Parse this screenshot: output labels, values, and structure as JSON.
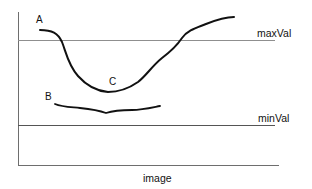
{
  "diagram": {
    "type": "threshold-curves",
    "colors": {
      "axis": "#6e6e6e",
      "threshold_line": "#8f8f8f",
      "curve": "#111111",
      "text": "#111111",
      "background": "#ffffff"
    },
    "x_axis_label": "image",
    "thresholds": {
      "max_label": "maxVal",
      "min_label": "minVal"
    },
    "point_labels": {
      "a": "A",
      "b": "B",
      "c": "C"
    },
    "curves": [
      {
        "id": "curve-A",
        "description": "Starts above maxVal at A, dips below maxVal to a minimum at C (between maxVal and minVal), rises above maxVal again"
      },
      {
        "id": "curve-B",
        "description": "Nearly flat curve at B, lying between maxVal and minVal"
      }
    ]
  }
}
